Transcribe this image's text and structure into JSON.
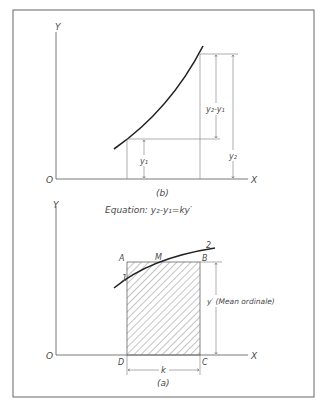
{
  "figure": {
    "top_panel": {
      "caption": "(b)",
      "axis_y_label": "Y",
      "axis_x_label": "X",
      "origin_label": "O",
      "dim_diff_label": "y₂-y₁",
      "dim_y1_label": "y₁",
      "dim_y2_label": "y₂"
    },
    "equation": "Equation: y₂-y₁=ky′",
    "bottom_panel": {
      "caption": "(a)",
      "axis_y_label": "Y",
      "axis_x_label": "X",
      "origin_label": "O",
      "corner_A": "A",
      "corner_B": "B",
      "corner_C": "C",
      "corner_D": "D",
      "point_M": "M",
      "point_1": "1",
      "point_2": "2",
      "dim_k_label": "k",
      "mean_ordinate_label": "y′ (Mean ordinale)"
    },
    "colors": {
      "line": "#555555",
      "curve": "#222222",
      "hatch": "#888888",
      "frame": "#666666"
    }
  }
}
